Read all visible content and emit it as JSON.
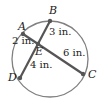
{
  "diagram": {
    "type": "intersecting-chords",
    "circle": {
      "cx": 50,
      "cy": 59,
      "r": 38,
      "stroke": "#777777"
    },
    "points": {
      "A": {
        "label": "A",
        "x": 23,
        "y": 34
      },
      "B": {
        "label": "B",
        "x": 50,
        "y": 21
      },
      "C": {
        "label": "C",
        "x": 83,
        "y": 74
      },
      "D": {
        "label": "D",
        "x": 20,
        "y": 78
      },
      "E": {
        "label": "E",
        "x": 38,
        "y": 44
      }
    },
    "chords": [
      {
        "name": "AC",
        "from": "A",
        "to": "C"
      },
      {
        "name": "BD",
        "from": "B",
        "to": "D"
      }
    ],
    "measurements": {
      "AE": "2 in.",
      "BE": "3 in.",
      "EC": "6 in.",
      "ED": "4 in."
    },
    "colors": {
      "segment": "#555555",
      "point": "#555555",
      "text": "#222222"
    }
  }
}
